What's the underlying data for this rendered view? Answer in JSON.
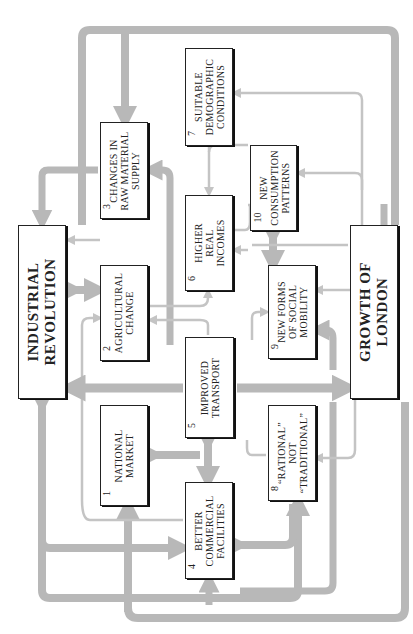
{
  "diagram": {
    "orientation": "rotated-90-ccw",
    "colors": {
      "arrow_thick": "#b8b8b8",
      "arrow_thin": "#c4c4c4",
      "box_border": "#222222",
      "text": "#222222"
    },
    "main_nodes": {
      "industrial_revolution": {
        "lines": [
          "INDUSTRIAL",
          "REVOLUTION"
        ]
      },
      "growth_of_london": {
        "lines": [
          "GROWTH OF",
          "LONDON"
        ]
      }
    },
    "nodes": [
      {
        "id": "n1",
        "number": "1",
        "lines": [
          "NATIONAL",
          "MARKET"
        ]
      },
      {
        "id": "n2",
        "number": "2",
        "lines": [
          "AGRICULTURAL",
          "CHANGE"
        ]
      },
      {
        "id": "n3",
        "number": "3",
        "lines": [
          "CHANGES IN",
          "RAW MATERIAL",
          "SUPPLY"
        ]
      },
      {
        "id": "n4",
        "number": "4",
        "lines": [
          "BETTER",
          "COMMERCIAL",
          "FACILITIES"
        ]
      },
      {
        "id": "n5",
        "number": "5",
        "lines": [
          "IMPROVED",
          "TRANSPORT"
        ]
      },
      {
        "id": "n6",
        "number": "6",
        "lines": [
          "HIGHER",
          "REAL",
          "INCOMES"
        ]
      },
      {
        "id": "n7",
        "number": "7",
        "lines": [
          "SUITABLE",
          "DEMOGRAPHIC",
          "CONDITIONS"
        ]
      },
      {
        "id": "n8",
        "number": "8",
        "lines": [
          "“RATIONAL”",
          "NOT",
          "“TRADITIONAL”"
        ]
      },
      {
        "id": "n9",
        "number": "9",
        "lines": [
          "NEW FORMS",
          "OF SOCIAL",
          "MOBILITY"
        ]
      },
      {
        "id": "n10",
        "number": "10",
        "lines": [
          "NEW",
          "CONSUMPTION",
          "PATTERNS"
        ]
      }
    ]
  }
}
